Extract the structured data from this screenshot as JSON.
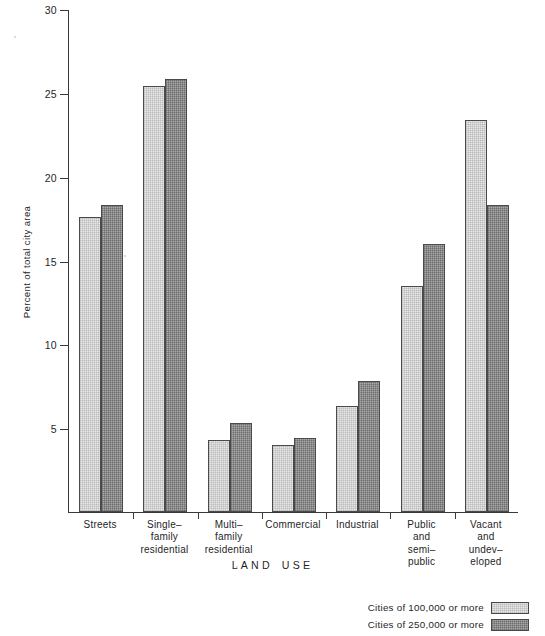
{
  "chart_data": {
    "type": "bar",
    "title": "",
    "xlabel": "LAND USE",
    "ylabel": "Percent of total city area",
    "ylim": [
      0,
      30
    ],
    "yticks": [
      0,
      5,
      10,
      15,
      20,
      25,
      30
    ],
    "ytick_labels": [
      "",
      "5",
      "10",
      "15",
      "20",
      "25",
      "30"
    ],
    "grid": false,
    "legend_position": "bottom-right",
    "categories": [
      "Streets",
      "Single–\nfamily\nresidential",
      "Multi–\nfamily\nresidential",
      "Commercial",
      "Industrial",
      "Public\nand\nsemi–\npublic",
      "Vacant\nand\nundev–\neloped"
    ],
    "series": [
      {
        "name": "Cities of 100,000 or more",
        "color": "#e8e8e8",
        "values": [
          17.6,
          25.4,
          4.3,
          4.0,
          6.3,
          13.5,
          23.4
        ]
      },
      {
        "name": "Cities of 250,000 or more",
        "color": "#a9a9a9",
        "values": [
          18.3,
          25.8,
          5.3,
          4.4,
          7.8,
          16.0,
          18.3
        ]
      }
    ]
  },
  "axis": {
    "y_title": "Percent of total city area",
    "x_title_letters": [
      "L",
      "A",
      "N",
      "D",
      "U",
      "S",
      "E"
    ],
    "x_title_words": [
      "LAND",
      "USE"
    ]
  },
  "legend": {
    "items": [
      {
        "label": "Cities of 100,000 or more",
        "swatch": "light"
      },
      {
        "label": "Cities of 250,000 or more",
        "swatch": "dark"
      }
    ]
  }
}
